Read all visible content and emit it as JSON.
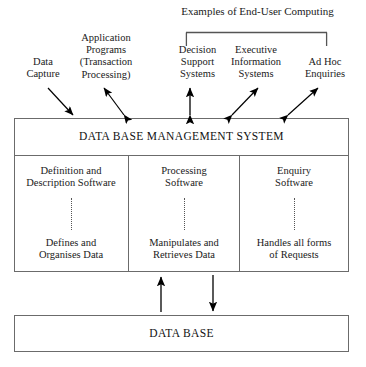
{
  "diagram": {
    "title_bracket": {
      "label": "Examples of End-User Computing",
      "covers": [
        "Decision Support Systems",
        "Executive Information Systems",
        "Ad Hoc Enquiries"
      ]
    },
    "sources": [
      {
        "id": "data-capture",
        "label": "Data\nCapture",
        "arrow": "single-down"
      },
      {
        "id": "application-programs",
        "label": "Application\nPrograms\n(Transaction\nProcessing)",
        "arrow": "double"
      },
      {
        "id": "decision-support-systems",
        "label": "Decision\nSupport\nSystems",
        "arrow": "double-vertical"
      },
      {
        "id": "executive-information-systems",
        "label": "Executive\nInformation\nSystems",
        "arrow": "double"
      },
      {
        "id": "ad-hoc-enquiries",
        "label": "Ad Hoc\nEnquiries",
        "arrow": "double"
      }
    ],
    "dbms": {
      "title": "DATA BASE MANAGEMENT SYSTEM",
      "columns": [
        {
          "id": "definition-description",
          "top": "Definition and\nDescription Software",
          "bottom": "Defines and\nOrganises Data"
        },
        {
          "id": "processing",
          "top": "Processing\nSoftware",
          "bottom": "Manipulates and\nRetrieves Data"
        },
        {
          "id": "enquiry",
          "top": "Enquiry\nSoftware",
          "bottom": "Handles all forms\nof Requests"
        }
      ]
    },
    "database": {
      "title": "DATA BASE"
    },
    "link_arrows": [
      {
        "id": "database-to-dbms",
        "direction": "up"
      },
      {
        "id": "dbms-to-database",
        "direction": "down"
      }
    ],
    "colors": {
      "stroke": "#6b6b6b",
      "arrow": "#000000",
      "text": "#1a1a1a",
      "background": "#ffffff"
    }
  }
}
